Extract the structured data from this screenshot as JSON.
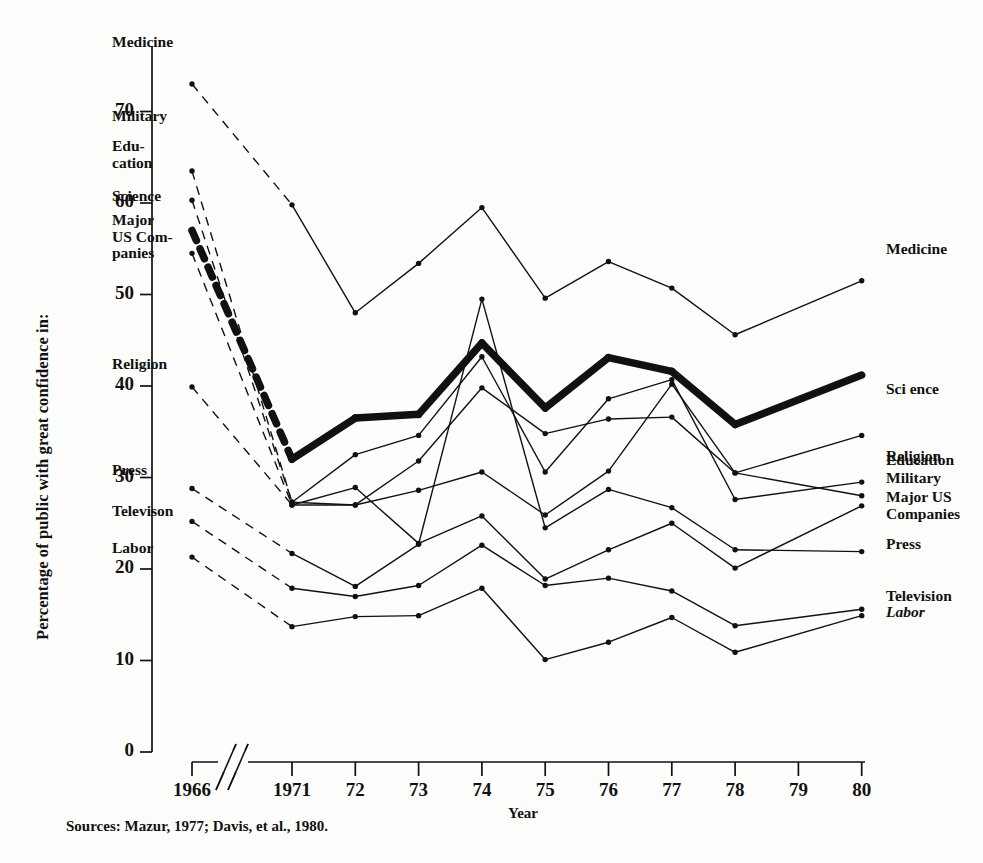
{
  "figure": {
    "ylabel": "Percentage of public with great confidence in:",
    "xlabel": "Year",
    "source_note": "Sources: Mazur, 1977; Davis, et al., 1980.",
    "ink_color": "#111111",
    "background_color": "#fdfdfb"
  },
  "axes": {
    "y_ticks": [
      "0",
      "10",
      "20",
      "30",
      "40",
      "50",
      "60",
      "70"
    ],
    "y_tick_values": [
      0,
      10,
      20,
      30,
      40,
      50,
      60,
      70
    ],
    "x_ticks": [
      "1966",
      "1971",
      "72",
      "73",
      "74",
      "75",
      "76",
      "77",
      "78",
      "79",
      "80"
    ],
    "axis_break_note": "broken x-axis between 1966 and 1971"
  },
  "left_labels": [
    {
      "name": "Medicine",
      "text": "Medicine",
      "value": 73.0
    },
    {
      "name": "Military",
      "text": "Military",
      "value": 63.5
    },
    {
      "name": "Education",
      "text": "Edu-\ncation",
      "value": 60.3
    },
    {
      "name": "Science",
      "text": "Science",
      "value": 57.0
    },
    {
      "name": "Major US Companies",
      "text": "Major\nUS Com-\npanies",
      "value": 54.5
    },
    {
      "name": "Religion",
      "text": "Religion",
      "value": 39.9
    },
    {
      "name": "Press",
      "text": "Press",
      "value": 28.8
    },
    {
      "name": "Television",
      "text": "Televison",
      "value": 25.2
    },
    {
      "name": "Labor",
      "text": "Labor",
      "value": 21.3
    }
  ],
  "right_labels": [
    {
      "name": "Medicine",
      "text": "Medicine",
      "value": 51.5
    },
    {
      "name": "Science",
      "text": "Sci ence",
      "value": 41.2
    },
    {
      "name": "Religion",
      "text": "Religion",
      "value": 34.6
    },
    {
      "name": "Education",
      "text": "Education",
      "value": 29.5
    },
    {
      "name": "Military",
      "text": "Military",
      "value": 28.0
    },
    {
      "name": "Major US Companies",
      "text": "Major US\nCompanies",
      "value": 26.9
    },
    {
      "name": "Press",
      "text": "Press",
      "value": 21.9
    },
    {
      "name": "Television",
      "text": "Television",
      "value": 15.6
    },
    {
      "name": "Labor",
      "text": "Labor",
      "value": 14.9
    }
  ],
  "chart_data": {
    "type": "line",
    "title": "",
    "xlabel": "Year",
    "ylabel": "Percentage of public with great confidence in:",
    "ylim": [
      0,
      75
    ],
    "grid": false,
    "legend": "inline end-labels on both sides",
    "x": [
      "1966",
      "1971",
      "72",
      "73",
      "74",
      "75",
      "76",
      "77",
      "78",
      "79",
      "80"
    ],
    "note": "The 1966-1971 segment is drawn dashed (survey gap); no data collected for 1979, lines interpolate 78 to 80.",
    "series": [
      {
        "name": "Medicine",
        "emphasis": "thin",
        "values": [
          73.0,
          59.8,
          48.0,
          53.4,
          59.5,
          49.6,
          53.6,
          50.7,
          45.6,
          null,
          51.5
        ]
      },
      {
        "name": "Science",
        "emphasis": "thick",
        "values": [
          57.0,
          32.0,
          36.5,
          36.9,
          44.7,
          37.6,
          43.1,
          41.6,
          35.8,
          null,
          41.2
        ]
      },
      {
        "name": "Religion",
        "emphasis": "thin",
        "values": [
          39.9,
          27.0,
          27.0,
          28.6,
          30.6,
          25.9,
          30.7,
          40.2,
          30.5,
          null,
          34.6
        ]
      },
      {
        "name": "Education",
        "emphasis": "thin",
        "values": [
          60.3,
          27.3,
          32.5,
          34.6,
          43.2,
          30.6,
          38.6,
          40.7,
          27.6,
          null,
          29.5
        ]
      },
      {
        "name": "Military",
        "emphasis": "thin",
        "values": [
          63.5,
          27.3,
          27.0,
          31.8,
          39.8,
          34.8,
          36.4,
          36.6,
          30.5,
          null,
          28.0
        ]
      },
      {
        "name": "Major US Companies",
        "emphasis": "thin",
        "values": [
          54.5,
          27.0,
          28.9,
          22.8,
          25.8,
          18.9,
          22.1,
          25.0,
          20.1,
          null,
          26.9
        ]
      },
      {
        "name": "Press",
        "emphasis": "thin",
        "values": [
          28.8,
          21.7,
          18.1,
          22.7,
          49.5,
          24.5,
          28.7,
          26.7,
          22.1,
          null,
          21.9
        ]
      },
      {
        "name": "Television",
        "emphasis": "thin",
        "values": [
          25.2,
          17.9,
          17.0,
          18.2,
          22.6,
          18.2,
          19.0,
          17.6,
          13.8,
          null,
          15.6
        ]
      },
      {
        "name": "Labor",
        "emphasis": "thin",
        "values": [
          21.3,
          13.7,
          14.8,
          14.9,
          17.9,
          10.1,
          12.0,
          14.7,
          10.9,
          null,
          14.9
        ]
      }
    ]
  }
}
